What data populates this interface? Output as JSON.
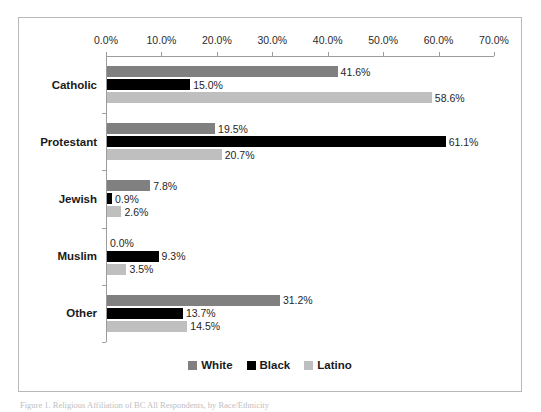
{
  "chart_data": {
    "type": "bar",
    "orientation": "horizontal",
    "title": "",
    "xlabel": "",
    "ylabel": "",
    "xlim": [
      0,
      70
    ],
    "xtick_step": 10,
    "xtick_labels": [
      "0.0%",
      "10.0%",
      "20.0%",
      "30.0%",
      "40.0%",
      "50.0%",
      "60.0%",
      "70.0%"
    ],
    "xtick_values": [
      0,
      10,
      20,
      30,
      40,
      50,
      60,
      70
    ],
    "grid": false,
    "legend_position": "bottom",
    "categories": [
      "Catholic",
      "Protestant",
      "Jewish",
      "Muslim",
      "Other"
    ],
    "series": [
      {
        "name": "White",
        "color": "#808080",
        "values": [
          41.6,
          19.5,
          7.8,
          0.0,
          31.2
        ],
        "labels": [
          "41.6%",
          "19.5%",
          "7.8%",
          "0.0%",
          "31.2%"
        ]
      },
      {
        "name": "Black",
        "color": "#000000",
        "values": [
          15.0,
          61.1,
          0.9,
          9.3,
          13.7
        ],
        "labels": [
          "15.0%",
          "61.1%",
          "0.9%",
          "9.3%",
          "13.7%"
        ]
      },
      {
        "name": "Latino",
        "color": "#bfbfbf",
        "values": [
          58.6,
          20.7,
          2.6,
          3.5,
          14.5
        ],
        "labels": [
          "58.6%",
          "20.7%",
          "2.6%",
          "3.5%",
          "14.5%"
        ]
      }
    ]
  },
  "caption": {
    "text": "Figure 1. Religious Affiliation of BC All Respondents, by Race/Ethnicity"
  }
}
